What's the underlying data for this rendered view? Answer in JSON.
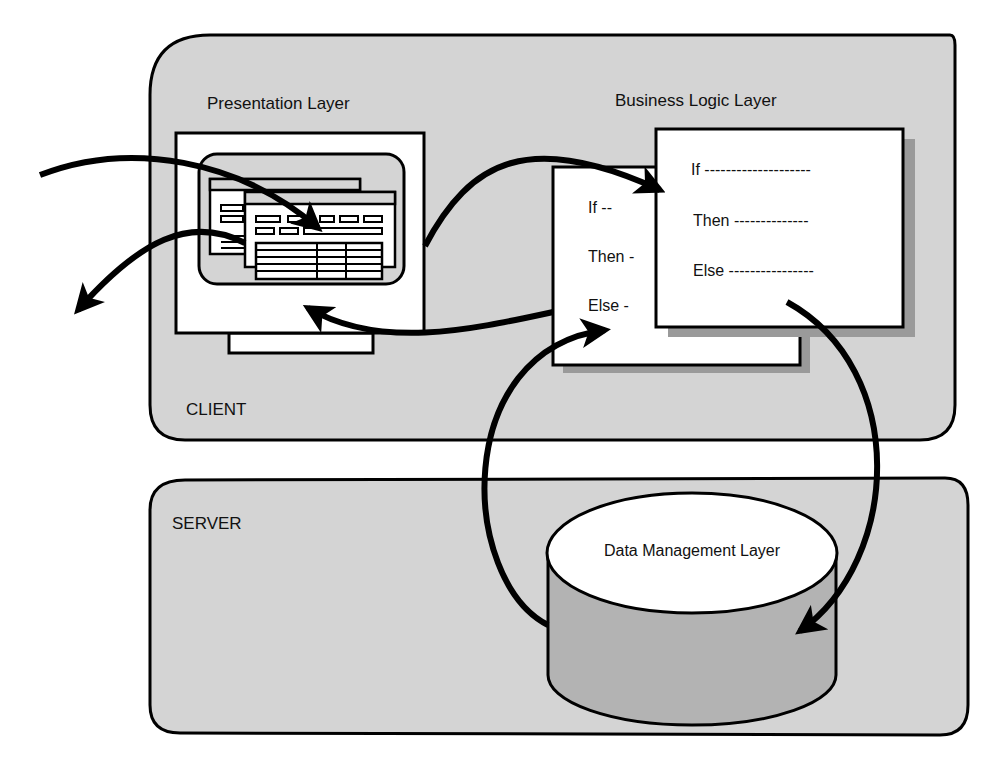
{
  "diagram": {
    "client": {
      "label": "CLIENT"
    },
    "server": {
      "label": "SERVER"
    },
    "presentation": {
      "label": "Presentation Layer"
    },
    "business": {
      "label": "Business Logic Layer",
      "back_card": {
        "if": "If --",
        "then": "Then -",
        "else": "Else -"
      },
      "front_card": {
        "if": "If --------------------",
        "then": "Then --------------",
        "else": "Else ----------------"
      }
    },
    "data": {
      "label": "Data Management Layer"
    },
    "colors": {
      "panel": "#d4d4d4",
      "cylinder_side": "#b3b3b3",
      "shadow": "#9a9a9a",
      "ink": "#000000"
    }
  }
}
